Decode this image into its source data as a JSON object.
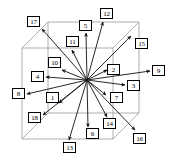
{
  "figure": {
    "type": "cube-direction-diagram",
    "width": 169,
    "height": 164,
    "background_color": "#ffffff",
    "line_color": "#000000",
    "cube_edge_color": "#8c8c8c",
    "center_point": {
      "x": 87,
      "y": 80
    }
  },
  "cube": {
    "front_face": {
      "top_left": {
        "x": 22,
        "y": 48
      },
      "top_right": {
        "x": 113,
        "y": 48
      },
      "bottom_right": {
        "x": 113,
        "y": 139
      },
      "bottom_left": {
        "x": 22,
        "y": 139
      }
    },
    "back_face": {
      "top_left": {
        "x": 48,
        "y": 22
      },
      "top_right": {
        "x": 139,
        "y": 22
      },
      "bottom_right": {
        "x": 139,
        "y": 113
      },
      "bottom_left": {
        "x": 48,
        "y": 113
      }
    }
  },
  "arrows": [
    {
      "id": "1",
      "label": "1",
      "tip": {
        "x": 59,
        "y": 103
      },
      "box": {
        "x": 46,
        "y": 92
      }
    },
    {
      "id": "2",
      "label": "2",
      "tip": {
        "x": 107,
        "y": 70
      },
      "box": {
        "x": 107,
        "y": 64
      }
    },
    {
      "id": "3",
      "label": "3",
      "tip": {
        "x": 125,
        "y": 85
      },
      "box": {
        "x": 127,
        "y": 80
      }
    },
    {
      "id": "4",
      "label": "4",
      "tip": {
        "x": 46,
        "y": 77
      },
      "box": {
        "x": 31,
        "y": 71
      }
    },
    {
      "id": "5",
      "label": "5",
      "tip": {
        "x": 86,
        "y": 33
      },
      "box": {
        "x": 79,
        "y": 20
      }
    },
    {
      "id": "6",
      "label": "6",
      "tip": {
        "x": 88,
        "y": 127
      },
      "box": {
        "x": 86,
        "y": 128
      }
    },
    {
      "id": "7",
      "label": "7",
      "tip": {
        "x": 106,
        "y": 95
      },
      "box": {
        "x": 110,
        "y": 92
      }
    },
    {
      "id": "8",
      "label": "8",
      "tip": {
        "x": 27,
        "y": 94
      },
      "box": {
        "x": 12,
        "y": 88
      }
    },
    {
      "id": "9",
      "label": "9",
      "tip": {
        "x": 150,
        "y": 71
      },
      "box": {
        "x": 152,
        "y": 65
      }
    },
    {
      "id": "10",
      "label": "10",
      "tip": {
        "x": 62,
        "y": 70
      },
      "box": {
        "x": 48,
        "y": 57
      }
    },
    {
      "id": "11",
      "label": "11",
      "tip": {
        "x": 72,
        "y": 50
      },
      "box": {
        "x": 66,
        "y": 36
      }
    },
    {
      "id": "12",
      "label": "12",
      "tip": {
        "x": 103,
        "y": 22
      },
      "box": {
        "x": 100,
        "y": 8
      }
    },
    {
      "id": "13",
      "label": "13",
      "tip": {
        "x": 69,
        "y": 140
      },
      "box": {
        "x": 63,
        "y": 142
      }
    },
    {
      "id": "14",
      "label": "14",
      "tip": {
        "x": 107,
        "y": 117
      },
      "box": {
        "x": 103,
        "y": 118
      }
    },
    {
      "id": "15",
      "label": "15",
      "tip": {
        "x": 131,
        "y": 36
      },
      "box": {
        "x": 135,
        "y": 38
      }
    },
    {
      "id": "16",
      "label": "16",
      "tip": {
        "x": 135,
        "y": 130
      },
      "box": {
        "x": 133,
        "y": 133
      }
    },
    {
      "id": "17",
      "label": "17",
      "tip": {
        "x": 42,
        "y": 29
      },
      "box": {
        "x": 27,
        "y": 16
      }
    },
    {
      "id": "18",
      "label": "18",
      "tip": {
        "x": 43,
        "y": 115
      },
      "box": {
        "x": 28,
        "y": 112
      }
    }
  ],
  "chart_data": {
    "type": "scatter",
    "title": "",
    "xlabel": "",
    "ylabel": "",
    "categories": [
      "1",
      "2",
      "3",
      "4",
      "5",
      "6",
      "7",
      "8",
      "9",
      "10",
      "11",
      "12",
      "13",
      "14",
      "15",
      "16",
      "17",
      "18"
    ],
    "values": [
      1,
      2,
      3,
      4,
      5,
      6,
      7,
      8,
      9,
      10,
      11,
      12,
      13,
      14,
      15,
      16,
      17,
      18
    ]
  }
}
